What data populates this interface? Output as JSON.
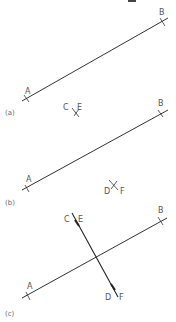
{
  "figure": {
    "panels": [
      {
        "caption": "(a)",
        "labels": {
          "A": "A",
          "B": "B",
          "C": "C",
          "E": "E"
        }
      },
      {
        "caption": "(b)",
        "labels": {
          "A": "A",
          "B": "B",
          "D": "D",
          "F": "F"
        }
      },
      {
        "caption": "(c)",
        "labels": {
          "A": "A",
          "B": "B",
          "C": "C",
          "E": "E",
          "D": "D",
          "F": "F"
        }
      }
    ],
    "colors": {
      "line": "#333333",
      "text": "#555555"
    }
  }
}
